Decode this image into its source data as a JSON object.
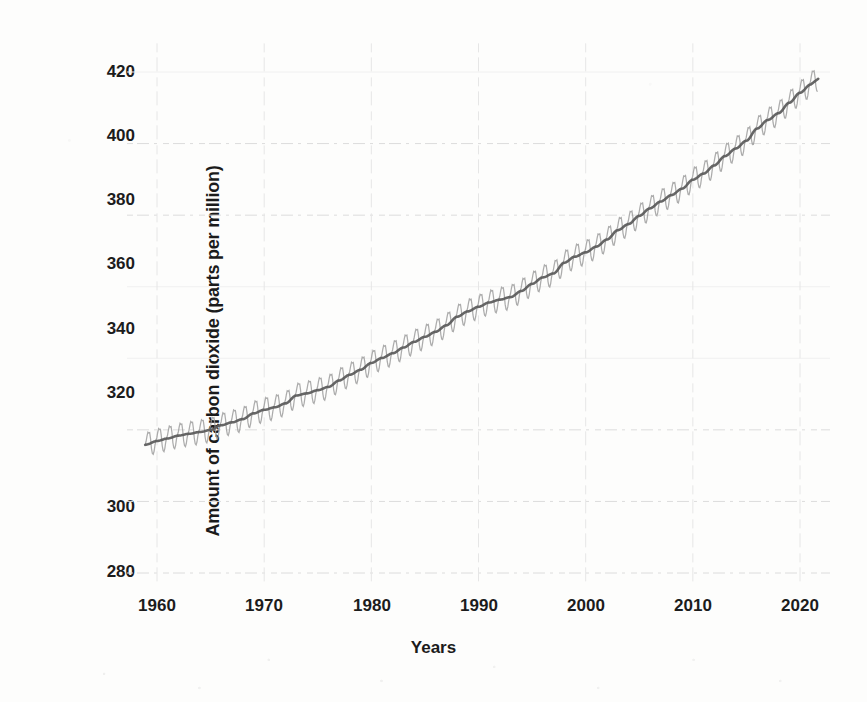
{
  "chart_data": {
    "type": "line",
    "title": "",
    "subtitle": "",
    "xlabel": "Years",
    "ylabel": "Amount of carbon dioxide (parts per million)",
    "xlim": [
      1957,
      2023
    ],
    "ylim": [
      275,
      428
    ],
    "xticks": [
      1960,
      1970,
      1980,
      1990,
      2000,
      2010,
      2020
    ],
    "xtick_labels": [
      "1960",
      "1970",
      "1980",
      "1990",
      "2000",
      "2010",
      "2020"
    ],
    "yticks": [
      280,
      300,
      320,
      340,
      360,
      380,
      400,
      420
    ],
    "ytick_labels": [
      "280",
      "300",
      "320",
      "340",
      "360",
      "380",
      "400",
      "420"
    ],
    "grid": "both-faint",
    "legend": "none",
    "annotations": [],
    "series": [
      {
        "name": "Monthly mean CO2 (seasonal sawtooth)",
        "color": "#9a9a9a",
        "style": "sawtooth-oscillation",
        "seasonal_amplitude_ppm": 3.1,
        "values": []
      },
      {
        "name": "Annual trend (smoothed)",
        "color": "#5a5a5a",
        "style": "solid",
        "x": [
          1959,
          1960,
          1961,
          1962,
          1963,
          1964,
          1965,
          1966,
          1967,
          1968,
          1969,
          1970,
          1971,
          1972,
          1973,
          1974,
          1975,
          1976,
          1977,
          1978,
          1979,
          1980,
          1981,
          1982,
          1983,
          1984,
          1985,
          1986,
          1987,
          1988,
          1989,
          1990,
          1991,
          1992,
          1993,
          1994,
          1995,
          1996,
          1997,
          1998,
          1999,
          2000,
          2001,
          2002,
          2003,
          2004,
          2005,
          2006,
          2007,
          2008,
          2009,
          2010,
          2011,
          2012,
          2013,
          2014,
          2015,
          2016,
          2017,
          2018,
          2019,
          2020,
          2021
        ],
        "values": [
          315.9,
          316.9,
          317.6,
          318.4,
          318.9,
          319.4,
          320.0,
          321.3,
          322.1,
          323.0,
          324.6,
          325.6,
          326.3,
          327.4,
          329.6,
          330.2,
          331.1,
          332.0,
          333.8,
          335.4,
          336.8,
          338.7,
          340.1,
          341.4,
          343.0,
          344.6,
          346.0,
          347.4,
          349.2,
          351.6,
          353.1,
          354.4,
          355.6,
          356.4,
          357.1,
          358.8,
          360.8,
          362.6,
          363.7,
          366.7,
          368.4,
          369.6,
          371.2,
          373.2,
          375.8,
          377.5,
          379.8,
          381.9,
          383.8,
          385.6,
          387.4,
          389.9,
          391.6,
          393.9,
          396.5,
          398.6,
          400.8,
          404.2,
          406.6,
          408.5,
          411.4,
          414.2,
          416.5
        ]
      }
    ],
    "units": "parts per million",
    "start_value_ppm": 315.9,
    "end_value_ppm": 416.5
  },
  "axes": {
    "y_title": "Amount of carbon dioxide (parts per million)",
    "x_title": "Years"
  }
}
